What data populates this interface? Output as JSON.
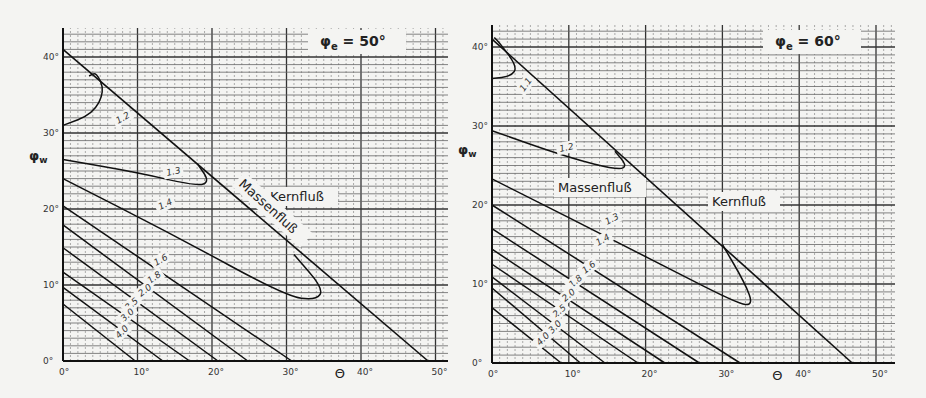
{
  "chart_data": [
    {
      "type": "line",
      "title": "φe = 50°",
      "xlabel": "Θ",
      "ylabel": "φw",
      "xlim": [
        0,
        52
      ],
      "ylim": [
        0,
        42
      ],
      "xticks": [
        "0°",
        "10°",
        "20°",
        "30°",
        "40°",
        "50°"
      ],
      "yticks": [
        "0°",
        "10°",
        "20°",
        "30°",
        "40°"
      ],
      "grid": true,
      "region_labels": [
        "Massenfluß",
        "Kernfluß"
      ],
      "boundary": {
        "name": "Kernfluß/Massenfluß boundary",
        "points": [
          [
            0,
            41
          ],
          [
            49,
            0
          ]
        ]
      },
      "series": [
        {
          "name": "1.2",
          "points": [
            [
              0,
              31
            ],
            [
              4,
              32.5
            ],
            [
              5.6,
              35.5
            ],
            [
              4.5,
              38
            ],
            [
              3.5,
              37.5
            ]
          ]
        },
        {
          "name": "1.3",
          "points": [
            [
              0,
              26.5
            ],
            [
              10,
              24.8
            ],
            [
              18,
              23
            ],
            [
              19.7,
              23.6
            ],
            [
              18,
              26
            ]
          ]
        },
        {
          "name": "1.4",
          "points": [
            [
              0,
              24
            ],
            [
              15,
              16.5
            ],
            [
              30,
              8.5
            ],
            [
              34,
              8
            ],
            [
              35,
              9.5
            ],
            [
              31,
              14
            ]
          ]
        },
        {
          "name": "1.6",
          "points": [
            [
              0,
              20.4
            ],
            [
              30.7,
              0
            ]
          ]
        },
        {
          "name": "1.8",
          "points": [
            [
              0,
              17.9
            ],
            [
              24.8,
              0
            ]
          ]
        },
        {
          "name": "2.0",
          "points": [
            [
              0,
              14.9
            ],
            [
              20.8,
              0
            ]
          ]
        },
        {
          "name": "2.5",
          "points": [
            [
              0,
              11.7
            ],
            [
              17,
              0
            ]
          ]
        },
        {
          "name": "3.0",
          "points": [
            [
              0,
              9.7
            ],
            [
              13.4,
              0
            ]
          ]
        },
        {
          "name": "4.0",
          "points": [
            [
              0,
              7.5
            ],
            [
              9.7,
              0
            ]
          ]
        }
      ]
    },
    {
      "type": "line",
      "title": "φe = 60°",
      "xlabel": "Θ",
      "ylabel": "φw",
      "xlim": [
        0,
        52
      ],
      "ylim": [
        0,
        42
      ],
      "xticks": [
        "0°",
        "10°",
        "20°",
        "30°",
        "40°",
        "50°"
      ],
      "yticks": [
        "0°",
        "10°",
        "20°",
        "30°",
        "40°"
      ],
      "grid": true,
      "region_labels": [
        "Massenfluß",
        "Kernfluß"
      ],
      "boundary": {
        "name": "Kernfluß/Massenfluß boundary",
        "points": [
          [
            0,
            41
          ],
          [
            46.9,
            0
          ]
        ]
      },
      "series": [
        {
          "name": "1.1",
          "points": [
            [
              0,
              36
            ],
            [
              2.5,
              36.3
            ],
            [
              3.3,
              37.5
            ],
            [
              1,
              40.5
            ],
            [
              0.3,
              41.2
            ]
          ]
        },
        {
          "name": "1.2",
          "points": [
            [
              0,
              29.4
            ],
            [
              10,
              26
            ],
            [
              16.5,
              24.4
            ],
            [
              17.6,
              25
            ],
            [
              16,
              26.8
            ]
          ]
        },
        {
          "name": "1.3",
          "points": [
            [
              0,
              23.3
            ],
            [
              20,
              13.5
            ],
            [
              32,
              7.5
            ],
            [
              34,
              7.3
            ],
            [
              33,
              10
            ],
            [
              30,
              15
            ]
          ]
        },
        {
          "name": "1.4",
          "points": [
            [
              0,
              20
            ],
            [
              32.3,
              0
            ]
          ]
        },
        {
          "name": "1.6",
          "points": [
            [
              0,
              17
            ],
            [
              27,
              0
            ]
          ]
        },
        {
          "name": "1.8",
          "points": [
            [
              0,
              14.4
            ],
            [
              22.5,
              0
            ]
          ]
        },
        {
          "name": "2.0",
          "points": [
            [
              0,
              12.5
            ],
            [
              19,
              0
            ]
          ]
        },
        {
          "name": "2.5",
          "points": [
            [
              0,
              10.9
            ],
            [
              14.7,
              0
            ]
          ]
        },
        {
          "name": "3.0",
          "points": [
            [
              0,
              9.5
            ],
            [
              11.5,
              0
            ]
          ]
        },
        {
          "name": "4.0",
          "points": [
            [
              0,
              7
            ],
            [
              9,
              0
            ]
          ]
        }
      ]
    }
  ],
  "charts": [
    {
      "title": "φe = 50°",
      "xlabel": "Θ",
      "ylabel": "φw",
      "massenfluss": "Massenfluß",
      "kernfluss": "Kernfluß"
    },
    {
      "title": "φe = 60°",
      "xlabel": "Θ",
      "ylabel": "φw",
      "massenfluss": "Massenfluß",
      "kernfluss": "Kernfluß"
    }
  ]
}
